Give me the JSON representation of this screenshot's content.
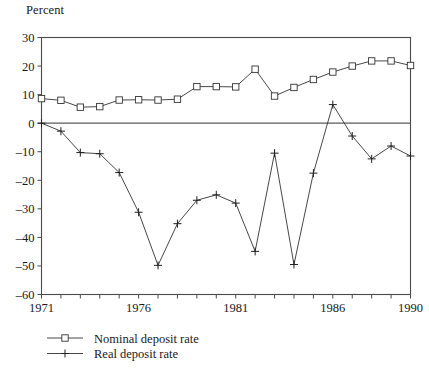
{
  "chart_data": {
    "type": "line",
    "title": "",
    "ylabel": "Percent",
    "xlabel": "",
    "ylim": [
      -60,
      30
    ],
    "yticks": [
      30,
      20,
      10,
      0,
      -10,
      -20,
      -30,
      -40,
      -50,
      -60
    ],
    "ytick_labels": [
      "30",
      "20",
      "10",
      "0",
      "–10",
      "–20",
      "–30",
      "–40",
      "–50",
      "–60"
    ],
    "xlim": [
      1971,
      1990
    ],
    "x": [
      1971,
      1972,
      1973,
      1974,
      1975,
      1976,
      1977,
      1978,
      1979,
      1980,
      1981,
      1982,
      1983,
      1984,
      1985,
      1986,
      1987,
      1988,
      1989,
      1990
    ],
    "xticks": [
      1971,
      1972,
      1973,
      1974,
      1975,
      1976,
      1977,
      1978,
      1979,
      1980,
      1981,
      1982,
      1983,
      1984,
      1985,
      1986,
      1987,
      1988,
      1989,
      1990
    ],
    "xtick_labels": [
      "1971",
      "",
      "",
      "",
      "",
      "1976",
      "",
      "",
      "",
      "",
      "1981",
      "",
      "",
      "",
      "",
      "1986",
      "",
      "",
      "",
      "1990"
    ],
    "grid": false,
    "legend_position": "below-left",
    "series": [
      {
        "name": "Nominal deposit rate",
        "marker": "open-square",
        "values": [
          8.6,
          8.0,
          5.6,
          5.8,
          8.1,
          8.2,
          8.1,
          8.4,
          12.8,
          12.8,
          12.7,
          18.9,
          9.5,
          12.5,
          15.3,
          17.9,
          20.0,
          21.8,
          21.8,
          20.2
        ]
      },
      {
        "name": "Real deposit rate",
        "marker": "plus",
        "values": [
          0.0,
          -2.8,
          -10.3,
          -10.7,
          -17.3,
          -31.2,
          -49.8,
          -35.2,
          -27.0,
          -25.1,
          -28.0,
          -44.9,
          -10.5,
          -49.5,
          -17.5,
          6.5,
          -4.5,
          -12.5,
          -8.0,
          -11.5
        ]
      }
    ],
    "legend": [
      {
        "label": "Nominal deposit rate",
        "marker": "open-square"
      },
      {
        "label": "Real deposit rate",
        "marker": "plus"
      }
    ]
  }
}
